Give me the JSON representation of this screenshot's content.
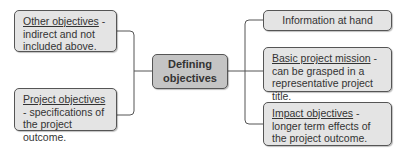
{
  "center": {
    "label_line1": "Defining",
    "label_line2": "objectives"
  },
  "left": [
    {
      "term": "Other objectives",
      "desc": " - indirect and not included above."
    },
    {
      "term": "Project objectives",
      "desc": " - specifications of the project outcome."
    }
  ],
  "right": [
    {
      "term": "",
      "desc": "Information at hand"
    },
    {
      "term": "Basic project mission",
      "desc": " - can be grasped in a representative project title."
    },
    {
      "term": "Impact objectives",
      "desc": " - longer term effects of the project outcome."
    }
  ],
  "colors": {
    "box_fill": "#e4e4e4",
    "center_fill": "#c4c4c4",
    "border": "#555555",
    "line": "#555555"
  }
}
